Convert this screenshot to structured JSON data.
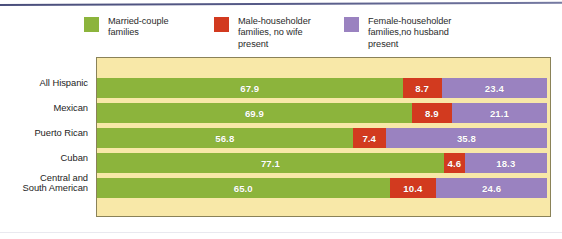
{
  "chart_data": {
    "type": "bar",
    "subtype": "stacked-horizontal-100",
    "title": "",
    "xlabel": "",
    "ylabel": "",
    "xlim": [
      0,
      100
    ],
    "grid": false,
    "legend_position": "top",
    "categories": [
      "All Hispanic",
      "Mexican",
      "Puerto Rican",
      "Cuban",
      "Central and\nSouth American"
    ],
    "series": [
      {
        "name": "Married-couple\nfamilies",
        "color": "#8cb43c",
        "values": [
          67.9,
          69.9,
          56.8,
          77.1,
          65.0
        ],
        "labels": [
          "67.9",
          "69.9",
          "56.8",
          "77.1",
          "65.0"
        ]
      },
      {
        "name": "Male-householder\nfamilies, no wife\npresent",
        "color": "#d23a1f",
        "values": [
          8.7,
          8.9,
          7.4,
          4.6,
          10.4
        ],
        "labels": [
          "8.7",
          "8.9",
          "7.4",
          "4.6",
          "10.4"
        ]
      },
      {
        "name": "Female-householder\nfamilies,no husband\npresent",
        "color": "#9a82c0",
        "values": [
          23.4,
          21.1,
          35.8,
          18.3,
          24.6
        ],
        "labels": [
          "23.4",
          "21.1",
          "35.8",
          "18.3",
          "24.6"
        ]
      }
    ]
  },
  "legend": {
    "items": [
      {
        "label": "Married-couple\nfamilies",
        "color": "#8cb43c",
        "swatch_name": "legend-swatch-married-couple"
      },
      {
        "label": "Male-householder\nfamilies, no wife\npresent",
        "color": "#d23a1f",
        "swatch_name": "legend-swatch-male-householder"
      },
      {
        "label": "Female-householder\nfamilies,no husband\npresent",
        "color": "#9a82c0",
        "swatch_name": "legend-swatch-female-householder"
      }
    ]
  },
  "panel": {
    "background_color": "#f8e8a8",
    "border_color": "#8a8258"
  },
  "rows": [
    {
      "label": "All Hispanic",
      "segments": [
        {
          "value": 67.9,
          "label": "67.9",
          "color": "#8cb43c"
        },
        {
          "value": 8.7,
          "label": "8.7",
          "color": "#d23a1f"
        },
        {
          "value": 23.4,
          "label": "23.4",
          "color": "#9a82c0"
        }
      ]
    },
    {
      "label": "Mexican",
      "segments": [
        {
          "value": 69.9,
          "label": "69.9",
          "color": "#8cb43c"
        },
        {
          "value": 8.9,
          "label": "8.9",
          "color": "#d23a1f"
        },
        {
          "value": 21.1,
          "label": "21.1",
          "color": "#9a82c0"
        }
      ]
    },
    {
      "label": "Puerto Rican",
      "segments": [
        {
          "value": 56.8,
          "label": "56.8",
          "color": "#8cb43c"
        },
        {
          "value": 7.4,
          "label": "7.4",
          "color": "#d23a1f"
        },
        {
          "value": 35.8,
          "label": "35.8",
          "color": "#9a82c0"
        }
      ]
    },
    {
      "label": "Cuban",
      "segments": [
        {
          "value": 77.1,
          "label": "77.1",
          "color": "#8cb43c"
        },
        {
          "value": 4.6,
          "label": "4.6",
          "color": "#d23a1f"
        },
        {
          "value": 18.3,
          "label": "18.3",
          "color": "#9a82c0"
        }
      ]
    },
    {
      "label": "Central and\nSouth American",
      "segments": [
        {
          "value": 65.0,
          "label": "65.0",
          "color": "#8cb43c"
        },
        {
          "value": 10.4,
          "label": "10.4",
          "color": "#d23a1f"
        },
        {
          "value": 24.6,
          "label": "24.6",
          "color": "#9a82c0"
        }
      ]
    }
  ]
}
